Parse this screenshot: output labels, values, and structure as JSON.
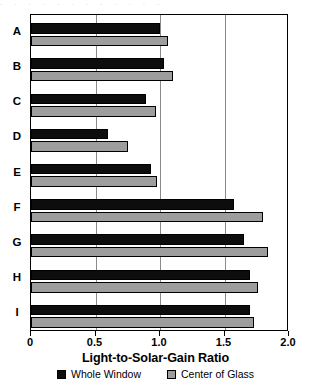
{
  "top_artifact": "· · · · · · · · · · · ·",
  "chart_data": {
    "type": "bar",
    "orientation": "horizontal",
    "title": "",
    "xlabel": "Light-to-Solar-Gain Ratio",
    "ylabel": "",
    "xlim": [
      0,
      2.0
    ],
    "grid": true,
    "gridlines": [
      0.5,
      1.0,
      1.5
    ],
    "legend_position": "bottom-center",
    "xticks": [
      0,
      0.5,
      1.0,
      1.5,
      2.0
    ],
    "xtick_labels": [
      "0",
      "0.5",
      "1.0",
      "1.5",
      "2.0"
    ],
    "categories": [
      "A",
      "B",
      "C",
      "D",
      "E",
      "F",
      "G",
      "H",
      "I"
    ],
    "series": [
      {
        "name": "Whole Window",
        "color": "#0d0d0d",
        "values": [
          1.0,
          1.03,
          0.89,
          0.6,
          0.93,
          1.57,
          1.65,
          1.7,
          1.7
        ]
      },
      {
        "name": "Center of Glass",
        "color": "#9d9d9d",
        "values": [
          1.06,
          1.1,
          0.97,
          0.75,
          0.98,
          1.8,
          1.84,
          1.76,
          1.73
        ]
      }
    ]
  }
}
